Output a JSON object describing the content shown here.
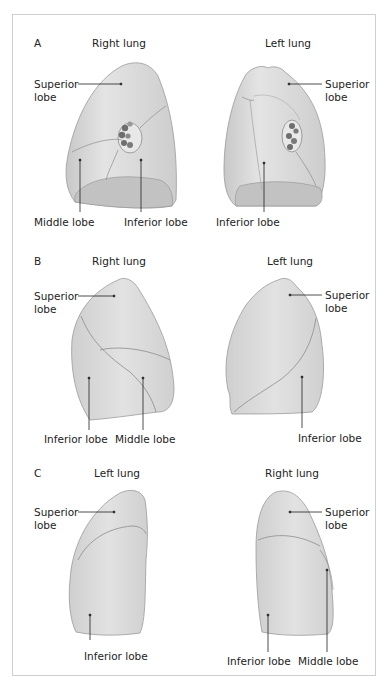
{
  "panels": [
    {
      "letter": "A",
      "left_title": "Right lung",
      "right_title": "Left lung",
      "left_labels": {
        "superior": "Superior",
        "superior2": "lobe",
        "middle": "Middle lobe",
        "inferior": "Inferior lobe"
      },
      "right_labels": {
        "superior": "Superior",
        "superior2": "lobe",
        "inferior": "Inferior lobe"
      }
    },
    {
      "letter": "B",
      "left_title": "Right lung",
      "right_title": "Left lung",
      "left_labels": {
        "superior": "Superior",
        "superior2": "lobe",
        "inferior": "Inferior lobe",
        "middle": "Middle lobe"
      },
      "right_labels": {
        "superior": "Superior",
        "superior2": "lobe",
        "inferior": "Inferior lobe"
      }
    },
    {
      "letter": "C",
      "left_title": "Left lung",
      "right_title": "Right lung",
      "left_labels": {
        "superior": "Superior",
        "superior2": "lobe",
        "inferior": "Inferior lobe"
      },
      "right_labels": {
        "superior": "Superior",
        "superior2": "lobe",
        "inferior": "Inferior lobe",
        "middle": "Middle lobe"
      }
    }
  ],
  "colors": {
    "lung_fill": "#d4d4d4",
    "lung_light": "#e6e6e6",
    "lung_edge": "#9a9a9a",
    "fissure": "#8c8c8c",
    "border": "#cfcfcf"
  }
}
